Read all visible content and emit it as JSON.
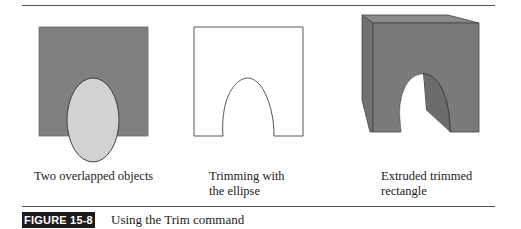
{
  "figure": {
    "label": "FIGURE 15-8",
    "title": "Using the Trim command"
  },
  "panels": [
    {
      "id": "overlapped",
      "caption_lines": [
        "Two overlapped objects"
      ],
      "rect_fill": "#808080",
      "ellipse_fill": "#d2d2d2"
    },
    {
      "id": "trimmed",
      "caption_lines": [
        "Trimming with",
        "the ellipse"
      ],
      "rect_fill": "#ffffff"
    },
    {
      "id": "extruded",
      "caption_lines": [
        "Extruded trimmed",
        "rectangle"
      ],
      "face_fill": "#7a7a7a",
      "side_fill": "#6e6e6e"
    }
  ],
  "colors": {
    "rule": "#555555",
    "label_bg": "#1a1a1a",
    "outline": "#333333"
  }
}
